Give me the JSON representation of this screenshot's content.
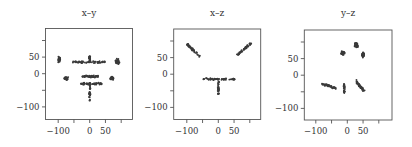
{
  "chart_data": [
    {
      "type": "scatter",
      "title": "x–y",
      "xlabel": "",
      "ylabel": "",
      "xlim": [
        -140,
        135
      ],
      "ylim": [
        -138,
        138
      ],
      "xticks": [
        -100,
        -50,
        0,
        50,
        100
      ],
      "xtick_labels": [
        "−100",
        "",
        "0",
        "50",
        ""
      ],
      "yticks": [
        -100,
        -50,
        0,
        50,
        100
      ],
      "ytick_labels": [
        "−100",
        "",
        "0",
        "50",
        ""
      ],
      "grid": false,
      "legend": null,
      "clusters": [
        {
          "name": "upper-left blob",
          "cx": -97,
          "cy": 42,
          "rx": 7,
          "ry": 12
        },
        {
          "name": "upper row",
          "x_from": -55,
          "x_to": 50,
          "y": 35
        },
        {
          "name": "upper stem",
          "x": 0,
          "y_from": 35,
          "y_to": 55
        },
        {
          "name": "upper-right blob",
          "cx": 88,
          "cy": 37,
          "rx": 7,
          "ry": 12
        },
        {
          "name": "middle-left blob",
          "cx": -75,
          "cy": -14,
          "rx": 8,
          "ry": 6
        },
        {
          "name": "middle row",
          "x_from": -25,
          "x_to": 28,
          "y": -8
        },
        {
          "name": "middle-right blob",
          "cx": 70,
          "cy": -14,
          "rx": 8,
          "ry": 6
        },
        {
          "name": "lower row",
          "x_from": -30,
          "x_to": 40,
          "y": -30
        },
        {
          "name": "lower stem",
          "x": 0,
          "y_from": -30,
          "y_to": -85
        }
      ]
    },
    {
      "type": "scatter",
      "title": "x–z",
      "xlabel": "",
      "ylabel": "",
      "xlim": [
        -140,
        135
      ],
      "ylim": [
        -138,
        138
      ],
      "xticks": [
        -100,
        -50,
        0,
        50,
        100
      ],
      "xtick_labels": [
        "−100",
        "",
        "0",
        "50",
        ""
      ],
      "yticks": [
        -100,
        -50,
        0,
        50,
        100
      ],
      "ytick_labels": [
        "−100",
        "",
        "0",
        "50",
        ""
      ],
      "grid": false,
      "legend": null,
      "clusters": [
        {
          "name": "left wing",
          "x_from": -100,
          "y_from": 91,
          "x_to": -61,
          "y_to": 55
        },
        {
          "name": "right wing",
          "x_from": 105,
          "y_from": 94,
          "x_to": 60,
          "y_to": 58
        },
        {
          "name": "bottom band",
          "x_from": -49,
          "x_to": 53,
          "y": -15
        },
        {
          "name": "bottom tip",
          "x": 0,
          "y_from": -15,
          "y_to": -60
        }
      ]
    },
    {
      "type": "scatter",
      "title": "y–z",
      "xlabel": "",
      "ylabel": "",
      "xlim": [
        -140,
        135
      ],
      "ylim": [
        -138,
        138
      ],
      "xticks": [
        -100,
        -50,
        0,
        50,
        100
      ],
      "xtick_labels": [
        "−100",
        "",
        "0",
        "50",
        ""
      ],
      "yticks": [
        -100,
        -50,
        0,
        50,
        100
      ],
      "ytick_labels": [
        "−100",
        "",
        "0",
        "50",
        ""
      ],
      "grid": false,
      "legend": null,
      "clusters": [
        {
          "name": "upper-center blob",
          "cx": -14,
          "cy": 67,
          "rx": 8,
          "ry": 8
        },
        {
          "name": "upper-right blob A",
          "cx": 28,
          "cy": 91,
          "rx": 8,
          "ry": 9
        },
        {
          "name": "upper-right blob B",
          "cx": 50,
          "cy": 61,
          "rx": 5,
          "ry": 9
        },
        {
          "name": "lower-left cluster",
          "x_from": -80,
          "x_to": -35,
          "y_from": -25,
          "y_to": -40
        },
        {
          "name": "lower stem",
          "x": -10,
          "y_from": -27,
          "y_to": -55
        },
        {
          "name": "lower-right L",
          "x_from": 28,
          "x_to": 53,
          "y_from": -18,
          "y_to": -48
        }
      ]
    }
  ],
  "figure": {
    "panel_titles": [
      "x–y",
      "x–z",
      "y–z"
    ],
    "point_color": "#3a3a3a",
    "axis_color": "#555555"
  }
}
